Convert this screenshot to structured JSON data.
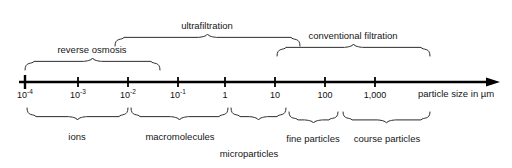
{
  "figure": {
    "title_text": "",
    "background_color": "#ffffff",
    "line_color": "#000000",
    "brace_color": "#2b2b2b",
    "text_color": "#161616"
  },
  "axis": {
    "caption": "particle size in µm",
    "caption_x": 418,
    "caption_y": 88,
    "start_x": 25,
    "end_x": 500,
    "y": 82,
    "ticks": [
      {
        "label_base": "10",
        "label_exp": "-4",
        "x": 25
      },
      {
        "label_base": "10",
        "label_exp": "-3",
        "x": 78
      },
      {
        "label_base": "10",
        "label_exp": "-2",
        "x": 128
      },
      {
        "label_base": "10",
        "label_exp": "-1",
        "x": 178
      },
      {
        "label_base": "1",
        "label_exp": "",
        "x": 225
      },
      {
        "label_base": "10",
        "label_exp": "",
        "x": 275
      },
      {
        "label_base": "100",
        "label_exp": "",
        "x": 325
      },
      {
        "label_base": "1,000",
        "label_exp": "",
        "x": 375
      }
    ]
  },
  "top_braces": [
    {
      "name": "reverse-osmosis",
      "label": "reverse osmosis",
      "left": 25,
      "right": 160,
      "baseline_y": 70,
      "height": 12,
      "label_x": 92,
      "label_y": 44
    },
    {
      "name": "ultrafiltration",
      "label": "ultrafiltration",
      "left": 115,
      "right": 300,
      "baseline_y": 46,
      "height": 12,
      "label_x": 207,
      "label_y": 20
    },
    {
      "name": "conventional-filtration",
      "label": "conventional filtration",
      "left": 277,
      "right": 430,
      "baseline_y": 56,
      "height": 12,
      "label_x": 353,
      "label_y": 30
    }
  ],
  "bottom_braces": [
    {
      "name": "ions",
      "label": "ions",
      "left": 27,
      "right": 128,
      "baseline_y": 108,
      "height": 12,
      "label_x": 77,
      "label_y": 131
    },
    {
      "name": "macromolecules",
      "label": "macromolecules",
      "left": 131,
      "right": 228,
      "baseline_y": 108,
      "height": 12,
      "label_x": 180,
      "label_y": 131
    },
    {
      "name": "microparticles",
      "label": "microparticles",
      "left": 231,
      "right": 286,
      "baseline_y": 108,
      "height": 12,
      "label_x": 249,
      "label_y": 148
    },
    {
      "name": "fine-particles",
      "label": "fine particles",
      "left": 289,
      "right": 338,
      "baseline_y": 112,
      "height": 11,
      "label_x": 313,
      "label_y": 133
    },
    {
      "name": "course-particles",
      "label": "course particles",
      "left": 343,
      "right": 430,
      "baseline_y": 112,
      "height": 11,
      "label_x": 387,
      "label_y": 133
    }
  ]
}
